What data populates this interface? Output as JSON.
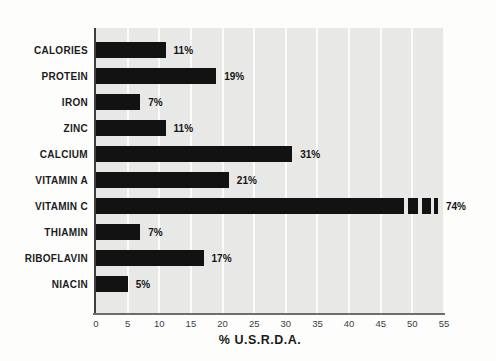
{
  "chart_data": {
    "type": "bar",
    "orientation": "horizontal",
    "title": "",
    "xlabel": "% U.S.R.D.A.",
    "ylabel": "",
    "xlim": [
      0,
      55
    ],
    "xticks": [
      "0",
      "5",
      "10",
      "15",
      "20",
      "25",
      "30",
      "35",
      "40",
      "45",
      "50",
      "55"
    ],
    "grid": "vertical white gridlines every 5 units on gray panel",
    "legend": "none",
    "categories": [
      "CALORIES",
      "PROTEIN",
      "IRON",
      "ZINC",
      "CALCIUM",
      "VITAMIN A",
      "VITAMIN C",
      "THIAMIN",
      "RIBOFLAVIN",
      "NIACIN"
    ],
    "values": [
      11,
      19,
      7,
      11,
      31,
      21,
      74,
      7,
      17,
      5
    ],
    "value_labels": [
      "11%",
      "19%",
      "7%",
      "11%",
      "31%",
      "21%",
      "74%",
      "7%",
      "17%",
      "5%"
    ],
    "truncation_note": "VITAMIN C (74%) exceeds the 55 axis max; its bar is truncated with three white break marks near the right edge",
    "colors": {
      "bar": "#121212",
      "plot_background": "#e8e8e7",
      "gridline": "#fbfbfa",
      "x_axis_line": "#6e6e6e",
      "y_axis_line": "#3f3f3f",
      "category_text": "#1c1c1c",
      "value_text": "#141414",
      "tick_text": "#3d3d3d",
      "page_background": "#fdfdfc"
    }
  }
}
